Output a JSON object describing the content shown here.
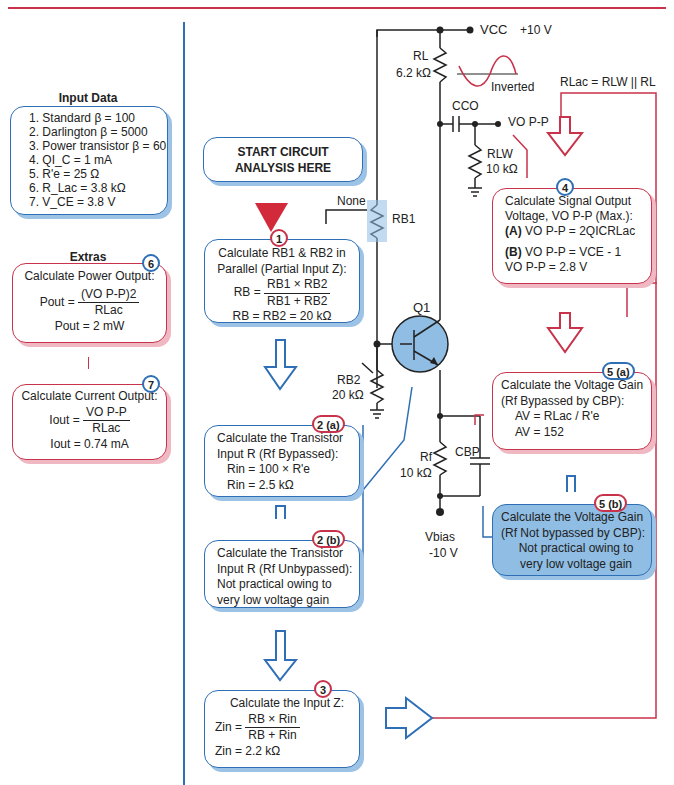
{
  "colors": {
    "accent_blue": "#2e6fb5",
    "accent_red": "#c8324a",
    "light_blue": "#8fbde3"
  },
  "input_data": {
    "title": "Input Data",
    "items": [
      "1. Standard β = 100",
      "2. Darlington β = 5000",
      "3. Power transistor β = 60",
      "4. QI_C = 1 mA",
      "5. R'e = 25 Ω",
      "6. R_Lac = 3.8 kΩ",
      "7. V_CE = 3.8 V"
    ]
  },
  "extras": {
    "title": "Extras",
    "step6": {
      "badge": "6",
      "heading": "Calculate Power Output:",
      "lhs": "Pout =",
      "num": "(VO P-P)2",
      "den": "RLac",
      "result": "Pout = 2 mW"
    },
    "step7": {
      "badge": "7",
      "heading": "Calculate Current Output:",
      "lhs": "Iout =",
      "num": "VO P-P",
      "den": "RLac",
      "result": "Iout = 0.74 mA"
    }
  },
  "start": {
    "line1": "START CIRCUIT",
    "line2": "ANALYSIS HERE"
  },
  "step1": {
    "badge": "1",
    "line1": "Calculate RB1 & RB2 in",
    "line2": "Parallel (Partial Input Z):",
    "lhs": "RB =",
    "num": "RB1 × RB2",
    "den": "RB1 + RB2",
    "result": "RB = RB2 = 20 kΩ"
  },
  "step2a": {
    "badge": "2 (a)",
    "line1": "Calculate the Transistor",
    "line2": "Input R (Rf Bypassed):",
    "eq1": "Rin = 100 × R'e",
    "eq2": "Rin = 2.5 kΩ"
  },
  "step2b": {
    "badge": "2 (b)",
    "line1": "Calculate the Transistor",
    "line2": "Input R (Rf Unbypassed):",
    "line3": "Not practical owing to",
    "line4": "very low voltage gain"
  },
  "step3": {
    "badge": "3",
    "heading": "Calculate the Input Z:",
    "lhs": "Zin =",
    "num": "RB × Rin",
    "den": "RB + Rin",
    "result": "Zin = 2.2 kΩ"
  },
  "step4": {
    "badge": "4",
    "line1": "Calculate Signal Output",
    "line2": "Voltage, VO P-P (Max.):",
    "eqA_label": "(A)",
    "eqA": "VO P-P = 2QICRLac",
    "eqB_label": "(B)",
    "eqB": "VO P-P = VCE - 1",
    "result": "VO P-P = 2.8 V"
  },
  "step5a": {
    "badge": "5 (a)",
    "line1": "Calculate the Voltage Gain",
    "line2": "(Rf Bypassed by CBP):",
    "eq1": "AV = RLac / R'e",
    "eq2": "AV = 152"
  },
  "step5b": {
    "badge": "5 (b)",
    "line1": "Calculate the Voltage Gain",
    "line2": "(Rf Not bypassed by CBP):",
    "line3": "Not practical owing to",
    "line4": "very low voltage gain"
  },
  "circuit": {
    "vcc": "VCC",
    "vcc_value": "+10 V",
    "rl": "RL",
    "rl_value": "6.2 kΩ",
    "cco": "CCO",
    "vo": "VO P-P",
    "rlw": "RLW",
    "rlw_value": "10 kΩ",
    "inverted": "Inverted",
    "rlac_formula": "RLac = RLW || RL",
    "rb1": "RB1",
    "none": "None",
    "rb2": "RB2",
    "rb2_value": "20 kΩ",
    "q1": "Q1",
    "rf": "Rf",
    "rf_value": "10 kΩ",
    "cbp": "CBP",
    "vbias": "Vbias",
    "vbias_value": "-10 V"
  }
}
